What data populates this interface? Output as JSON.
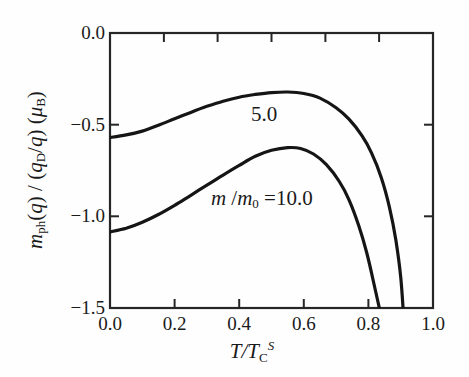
{
  "chart_data": {
    "type": "line",
    "title": "",
    "xlabel_parts": [
      {
        "t": "T",
        "s": "i"
      },
      {
        "t": "/",
        "s": "i"
      },
      {
        "t": "T",
        "s": "i"
      },
      {
        "t": "C",
        "s": "sub"
      },
      {
        "t": "S",
        "s": "sup"
      }
    ],
    "ylabel_parts": [
      {
        "t": "m",
        "s": "i"
      },
      {
        "t": "ph",
        "s": "sub"
      },
      {
        "t": "(",
        "s": "n"
      },
      {
        "t": "q",
        "s": "i"
      },
      {
        "t": ") / (",
        "s": "n"
      },
      {
        "t": "q",
        "s": "i"
      },
      {
        "t": "D",
        "s": "sub"
      },
      {
        "t": "/",
        "s": "n"
      },
      {
        "t": "q",
        "s": "i"
      },
      {
        "t": ")  (",
        "s": "n"
      },
      {
        "t": "μ",
        "s": "i"
      },
      {
        "t": "B",
        "s": "sub"
      },
      {
        "t": ")",
        "s": "n"
      }
    ],
    "xlim": [
      0.0,
      1.0
    ],
    "ylim": [
      -1.5,
      0.0
    ],
    "grid": false,
    "legend_position": "none",
    "x_ticks_bottom": [
      0.2,
      0.4,
      0.6,
      0.8
    ],
    "x_ticks_top": [
      0.167,
      0.333,
      0.5,
      0.667,
      0.833
    ],
    "y_ticks_left": [
      -0.5,
      -1.0
    ],
    "y_ticks_right": [
      -0.5,
      -1.0
    ],
    "x_tick_labels": [
      {
        "v": 0.0,
        "t": "0.0"
      },
      {
        "v": 0.2,
        "t": "0.2"
      },
      {
        "v": 0.4,
        "t": "0.4"
      },
      {
        "v": 0.6,
        "t": "0.6"
      },
      {
        "v": 0.8,
        "t": "0.8"
      },
      {
        "v": 1.0,
        "t": "1.0"
      }
    ],
    "y_tick_labels": [
      {
        "v": 0.0,
        "t": "0.0"
      },
      {
        "v": -0.5,
        "t": "−0.5"
      },
      {
        "v": -1.0,
        "t": "−1.0"
      },
      {
        "v": -1.5,
        "t": "−1.5"
      }
    ],
    "series": [
      {
        "name": "m/m0 = 5.0",
        "x": [
          0.0,
          0.05,
          0.1,
          0.15,
          0.2,
          0.25,
          0.3,
          0.35,
          0.4,
          0.45,
          0.5,
          0.55,
          0.6,
          0.65,
          0.7,
          0.74,
          0.78,
          0.81,
          0.84,
          0.865,
          0.885,
          0.9,
          0.908
        ],
        "y": [
          -0.57,
          -0.556,
          -0.535,
          -0.503,
          -0.468,
          -0.433,
          -0.4,
          -0.372,
          -0.35,
          -0.335,
          -0.325,
          -0.322,
          -0.33,
          -0.355,
          -0.408,
          -0.47,
          -0.56,
          -0.655,
          -0.79,
          -0.95,
          -1.13,
          -1.33,
          -1.52
        ]
      },
      {
        "name": "m/m0 = 10.0",
        "x": [
          0.0,
          0.05,
          0.1,
          0.15,
          0.2,
          0.25,
          0.3,
          0.35,
          0.4,
          0.45,
          0.5,
          0.55,
          0.59,
          0.63,
          0.67,
          0.71,
          0.74,
          0.77,
          0.795,
          0.815,
          0.83,
          0.838
        ],
        "y": [
          -1.085,
          -1.065,
          -1.032,
          -0.99,
          -0.94,
          -0.885,
          -0.83,
          -0.775,
          -0.722,
          -0.672,
          -0.64,
          -0.625,
          -0.63,
          -0.66,
          -0.718,
          -0.81,
          -0.91,
          -1.05,
          -1.2,
          -1.35,
          -1.47,
          -1.53
        ]
      }
    ],
    "annotations": [
      {
        "x": 0.477,
        "y": -0.443,
        "parts": [
          {
            "t": "5.0",
            "s": "n"
          }
        ]
      },
      {
        "x": 0.47,
        "y": -0.905,
        "parts": [
          {
            "t": "m",
            "s": "i"
          },
          {
            "t": " /",
            "s": "n"
          },
          {
            "t": "m",
            "s": "i"
          },
          {
            "t": "0",
            "s": "sub"
          },
          {
            "t": " =10.0",
            "s": "n"
          }
        ]
      }
    ],
    "line_color": "#151515",
    "frame_color": "#262626",
    "background_color": "#fefefe"
  }
}
